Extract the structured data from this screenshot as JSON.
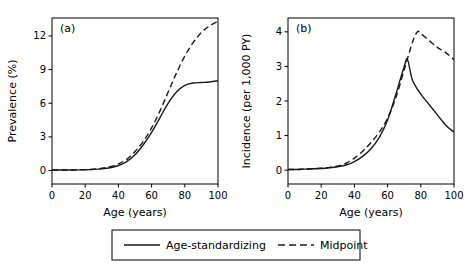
{
  "chart_data": [
    {
      "type": "line",
      "panel": "(a)",
      "title": "",
      "xlabel": "Age (years)",
      "ylabel": "Prevalence (%)",
      "xlim": [
        0,
        100
      ],
      "ylim": [
        -1.2,
        13.6
      ],
      "xticks": [
        0,
        20,
        40,
        60,
        80,
        100
      ],
      "yticks": [
        0,
        3,
        6,
        9,
        12
      ],
      "grid": false,
      "series": [
        {
          "name": "Age-standardizing",
          "style": "solid",
          "x": [
            0,
            5,
            10,
            15,
            20,
            25,
            30,
            35,
            40,
            45,
            50,
            55,
            60,
            65,
            70,
            75,
            80,
            85,
            90,
            95,
            100
          ],
          "y": [
            0.05,
            0.05,
            0.05,
            0.06,
            0.07,
            0.1,
            0.15,
            0.25,
            0.45,
            0.8,
            1.4,
            2.3,
            3.4,
            4.7,
            6.0,
            7.0,
            7.6,
            7.8,
            7.85,
            7.9,
            8.0
          ]
        },
        {
          "name": "Midpoint",
          "style": "dashed",
          "x": [
            0,
            5,
            10,
            15,
            20,
            25,
            30,
            35,
            40,
            45,
            50,
            55,
            60,
            65,
            70,
            75,
            80,
            85,
            90,
            95,
            100
          ],
          "y": [
            0.05,
            0.05,
            0.05,
            0.06,
            0.08,
            0.12,
            0.2,
            0.35,
            0.6,
            1.0,
            1.7,
            2.6,
            3.8,
            5.3,
            7.0,
            8.7,
            10.2,
            11.4,
            12.3,
            12.9,
            13.3
          ]
        }
      ]
    },
    {
      "type": "line",
      "panel": "(b)",
      "title": "",
      "xlabel": "Age (years)",
      "ylabel": "Incidence (per 1,000 PY)",
      "xlim": [
        0,
        100
      ],
      "ylim": [
        -0.4,
        4.4
      ],
      "xticks": [
        0,
        20,
        40,
        60,
        80,
        100
      ],
      "yticks": [
        0,
        1,
        2,
        3,
        4
      ],
      "grid": false,
      "series": [
        {
          "name": "Age-standardizing",
          "style": "solid",
          "x": [
            0,
            5,
            10,
            15,
            20,
            25,
            30,
            35,
            40,
            45,
            50,
            55,
            60,
            65,
            70,
            72,
            75,
            80,
            85,
            90,
            95,
            100
          ],
          "y": [
            0.02,
            0.02,
            0.03,
            0.04,
            0.05,
            0.07,
            0.1,
            0.15,
            0.25,
            0.4,
            0.62,
            0.95,
            1.45,
            2.2,
            3.0,
            3.2,
            2.6,
            2.2,
            1.9,
            1.6,
            1.3,
            1.1
          ]
        },
        {
          "name": "Midpoint",
          "style": "dashed",
          "x": [
            0,
            5,
            10,
            15,
            20,
            25,
            30,
            35,
            40,
            45,
            50,
            55,
            60,
            65,
            70,
            75,
            78,
            80,
            85,
            90,
            95,
            100
          ],
          "y": [
            0.02,
            0.02,
            0.03,
            0.04,
            0.06,
            0.08,
            0.12,
            0.2,
            0.35,
            0.55,
            0.8,
            1.1,
            1.5,
            2.1,
            2.9,
            3.7,
            4.0,
            3.95,
            3.75,
            3.55,
            3.4,
            3.2
          ]
        }
      ]
    }
  ],
  "legend": {
    "items": [
      {
        "label": "Age-standardizing",
        "style": "solid"
      },
      {
        "label": "Midpoint",
        "style": "dashed"
      }
    ]
  },
  "colors": {
    "line": "#1a1a1a",
    "axis": "#000000",
    "background": "#ffffff"
  }
}
